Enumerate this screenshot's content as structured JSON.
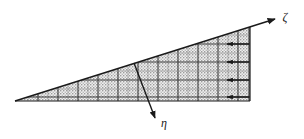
{
  "figure": {
    "type": "wedge-boundary-layer-diagram",
    "background_color": "#ffffff",
    "line_color": "#1a1a1a",
    "fill_color": "#b9b9b9",
    "grid_color": "#4a4a4a",
    "wedge": {
      "apex": {
        "x": 15,
        "y": 101
      },
      "top_right": {
        "x": 250,
        "y": 27
      },
      "bottom_right": {
        "x": 250,
        "y": 101
      },
      "base_y": 101
    },
    "axes": [
      {
        "name": "zeta-axis",
        "label": "ζ",
        "label_x": 285,
        "label_y": 21,
        "from": {
          "x": 15,
          "y": 101
        },
        "to": {
          "x": 277,
          "y": 18
        },
        "direction": "along-inclined-surface-upslope"
      },
      {
        "name": "eta-axis",
        "label": "η",
        "label_x": 161,
        "label_y": 127,
        "from": {
          "x": 134,
          "y": 63
        },
        "to": {
          "x": 155,
          "y": 119
        },
        "direction": "normal-into-wedge-downward"
      }
    ],
    "flow_arrows": {
      "count": 4,
      "direction": "left",
      "rows_y": [
        44,
        62,
        80,
        97
      ],
      "tip_x": 227,
      "tail_x": 249
    },
    "grid": {
      "vertical_line_count": 12,
      "horizontal_line_count": 5,
      "visible": true
    }
  }
}
